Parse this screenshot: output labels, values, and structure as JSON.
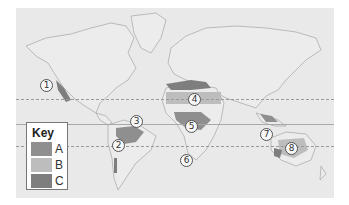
{
  "map": {
    "background": "#e9e9e9",
    "lines": [
      {
        "name": "tropic-of-cancer",
        "style": "dashed",
        "y": 91
      },
      {
        "name": "equator",
        "style": "solid",
        "y": 116
      },
      {
        "name": "tropic-of-capricorn",
        "style": "dashed",
        "y": 138
      }
    ],
    "markers": [
      {
        "label": "1",
        "x": 30,
        "y": 77
      },
      {
        "label": "2",
        "x": 102,
        "y": 137
      },
      {
        "label": "3",
        "x": 120,
        "y": 113
      },
      {
        "label": "4",
        "x": 178,
        "y": 91
      },
      {
        "label": "5",
        "x": 175,
        "y": 118
      },
      {
        "label": "6",
        "x": 170,
        "y": 152
      },
      {
        "label": "7",
        "x": 250,
        "y": 126
      },
      {
        "label": "8",
        "x": 275,
        "y": 140
      }
    ]
  },
  "key": {
    "title": "Key",
    "items": [
      {
        "label": "A",
        "color": "#8f8f8f"
      },
      {
        "label": "B",
        "color": "#bdbdbd"
      },
      {
        "label": "C",
        "color": "#7e7e7e"
      }
    ]
  }
}
